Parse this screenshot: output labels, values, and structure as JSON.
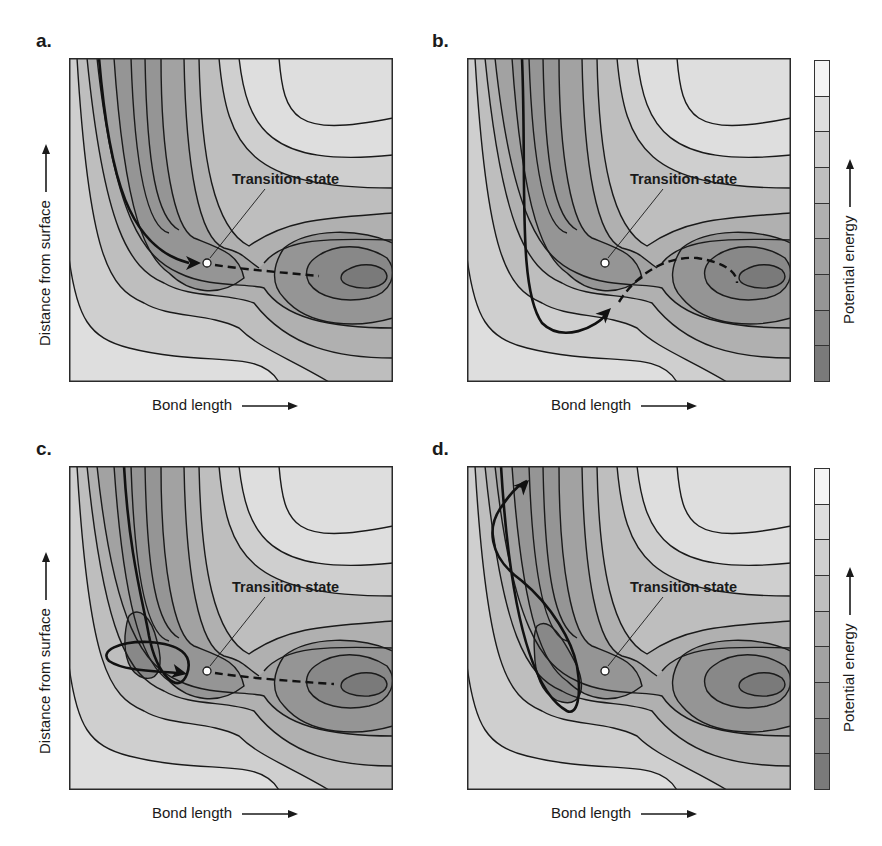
{
  "figure": {
    "panels": [
      {
        "id": "a",
        "label": "a.",
        "annotation": "Transition state",
        "trajectory": "direct",
        "description": "Trajectory runs down the entrance channel and crosses directly over the transition state into the product well"
      },
      {
        "id": "b",
        "label": "b.",
        "annotation": "Transition state",
        "trajectory": "corner-cutting",
        "description": "Trajectory cuts the corner below the transition state, then spirals into the product well"
      },
      {
        "id": "c",
        "label": "c.",
        "annotation": "Transition state",
        "trajectory": "trapped-then-crossing",
        "description": "Trajectory loops in the entrance-channel well before crossing the transition state"
      },
      {
        "id": "d",
        "label": "d.",
        "annotation": "Transition state",
        "trajectory": "reflected",
        "description": "Trajectory enters the entrance-channel well, oscillates, and is reflected back out to the surface"
      }
    ],
    "axes": {
      "x_label": "Bond length",
      "y_label": "Distance from surface"
    },
    "colorbar": {
      "label": "Potential energy",
      "levels": 9,
      "colors": [
        "#f4f4f4",
        "#dedede",
        "#cfcfcf",
        "#bebebe",
        "#b0b0b0",
        "#a2a2a2",
        "#959595",
        "#888888",
        "#7a7a7a"
      ]
    },
    "colors": {
      "contour_line": "#1a1a1a",
      "trajectory": "#111111",
      "transition_state_marker": "#ffffff",
      "background": "#ffffff"
    }
  }
}
